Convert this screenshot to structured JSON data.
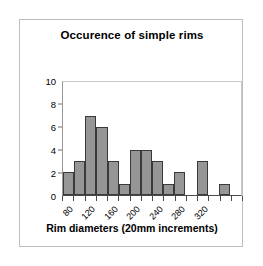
{
  "chart_data": {
    "type": "bar",
    "title": "Occurence of simple rims",
    "xlabel": "Rim diameters (20mm increments)",
    "ylabel": "",
    "ylim": [
      0,
      10
    ],
    "yticks": [
      0,
      2,
      4,
      6,
      8,
      10
    ],
    "grid": false,
    "legend": null,
    "categories": [
      "80",
      "100",
      "120",
      "140",
      "160",
      "180",
      "200",
      "220",
      "240",
      "260",
      "280",
      "300",
      "320",
      "340",
      "360",
      "380"
    ],
    "values": [
      2,
      3,
      7,
      6,
      3,
      1,
      4,
      4,
      3,
      1,
      2,
      0,
      3,
      0,
      1,
      0
    ],
    "xtick_labels_shown": [
      "80",
      "120",
      "160",
      "200",
      "240",
      "280",
      "320",
      "380"
    ],
    "bar_color": "#969696",
    "bar_border_color": "#3a3a3a",
    "frame_color": "#bdbdbd"
  },
  "axis": {
    "y_labels": [
      "10",
      "8",
      "6",
      "4",
      "2",
      "0"
    ],
    "y_values": [
      10,
      8,
      6,
      4,
      2,
      0
    ]
  }
}
